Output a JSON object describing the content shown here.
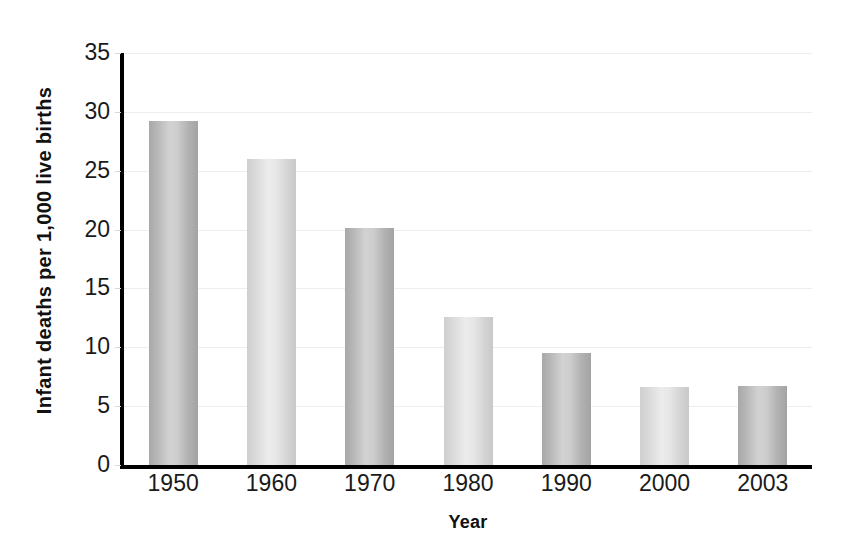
{
  "chart_data": {
    "type": "bar",
    "title": "",
    "xlabel": "Year",
    "ylabel": "Infant deaths per 1,000 live births",
    "categories": [
      "1950",
      "1960",
      "1970",
      "1980",
      "1990",
      "2000",
      "2003"
    ],
    "values": [
      29.2,
      26.0,
      20.1,
      12.6,
      9.5,
      6.6,
      6.7
    ],
    "ylim": [
      0,
      35
    ],
    "yticks": [
      0,
      5,
      10,
      15,
      20,
      25,
      30,
      35
    ],
    "ytick_labels": [
      "0",
      "5",
      "10",
      "15",
      "20",
      "25",
      "30",
      "35"
    ],
    "grid": true,
    "legend": "none",
    "bar_shading": [
      "dark",
      "light",
      "dark",
      "light",
      "dark",
      "light",
      "dark"
    ],
    "colors": {
      "bar_dark": "#b4b4b4",
      "bar_light": "#dcdcdc",
      "axis": "#000000",
      "gridline": "#eeeeee",
      "text": "#1a1a1a",
      "background": "#ffffff"
    }
  }
}
